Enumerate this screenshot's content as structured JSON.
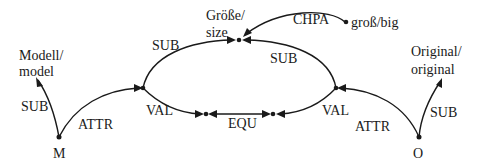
{
  "diagram": {
    "nodes": {
      "m": {
        "label": "M"
      },
      "o": {
        "label": "O"
      },
      "model": {
        "line1": "Modell/",
        "line2": "model"
      },
      "original": {
        "line1": "Original/",
        "line2": "original"
      },
      "size": {
        "line1": "Größe/",
        "line2": "size"
      },
      "big": {
        "label": "groß/big"
      }
    },
    "edges": {
      "m_sub": "SUB",
      "m_attr": "ATTR",
      "left_sub": "SUB",
      "right_sub": "SUB",
      "chpa": "CHPA",
      "left_val": "VAL",
      "right_val": "VAL",
      "equ": "EQU",
      "o_attr": "ATTR",
      "o_sub": "SUB"
    },
    "colors": {
      "ink": "#1a1a1a",
      "background": "#ffffff"
    }
  }
}
